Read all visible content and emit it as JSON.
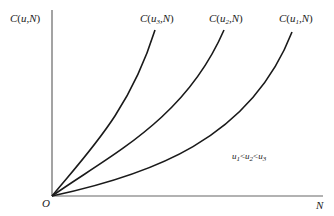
{
  "diagram": {
    "type": "cost curves",
    "y_axis_label": {
      "fn": "C",
      "args": "u,N"
    },
    "x_axis_label": "N",
    "origin_label": "O",
    "curves": [
      {
        "id": "u3",
        "fn": "C",
        "param": "u",
        "sub": "3",
        "var": "N"
      },
      {
        "id": "u2",
        "fn": "C",
        "param": "u",
        "sub": "2",
        "var": "N"
      },
      {
        "id": "u1",
        "fn": "C",
        "param": "u",
        "sub": "1",
        "var": "N"
      }
    ],
    "annotation": {
      "parts": [
        "u",
        "1",
        "<",
        "u",
        "2",
        "<",
        "u",
        "3"
      ]
    },
    "colors": {
      "axis": "#555555",
      "curve": "#1a1a1a",
      "text": "#222222"
    }
  }
}
